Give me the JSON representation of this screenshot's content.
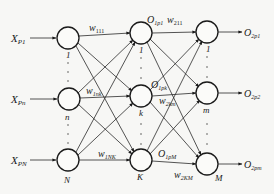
{
  "diagram": {
    "type": "three-layer feedforward neural network",
    "input_layer": {
      "inputs": [
        {
          "base": "X",
          "sub": "P1"
        },
        {
          "base": "X",
          "sub": "Pn"
        },
        {
          "base": "X",
          "sub": "PN"
        }
      ],
      "node_labels": [
        "1",
        "n",
        "N"
      ]
    },
    "hidden_layer": {
      "node_labels": [
        "1",
        "k",
        "K"
      ],
      "outputs": [
        {
          "base": "O",
          "sub": "1p1"
        },
        {
          "base": "O",
          "sub": "1pk"
        },
        {
          "base": "O",
          "sub": "1pM"
        }
      ]
    },
    "output_layer": {
      "node_labels": [
        "1",
        "m",
        "M"
      ],
      "outputs": [
        {
          "base": "O",
          "sub": "2p1"
        },
        {
          "base": "O",
          "sub": "2p2"
        },
        {
          "base": "O",
          "sub": "2pm"
        }
      ]
    },
    "weights": [
      {
        "base": "w",
        "sub": "111"
      },
      {
        "base": "w",
        "sub": "1nk"
      },
      {
        "base": "w",
        "sub": "1NK"
      },
      {
        "base": "w",
        "sub": "211"
      },
      {
        "base": "w",
        "sub": "2km"
      },
      {
        "base": "w",
        "sub": "2KM"
      }
    ]
  }
}
